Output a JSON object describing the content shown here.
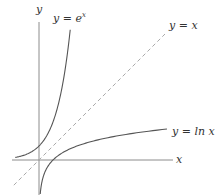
{
  "chart_data": {
    "type": "line",
    "title": "",
    "xlabel": "x",
    "ylabel": "y",
    "grid": false,
    "legend": "none (inline curve labels)",
    "xlim": [
      -1.9,
      9.6
    ],
    "ylim": [
      -2.5,
      9.3
    ],
    "series": [
      {
        "name": "y = e^x",
        "label": "y = e",
        "label_sup": "x",
        "style": "solid",
        "color": "#555555",
        "x": [
          -1.7,
          -1.0,
          -0.5,
          0,
          0.5,
          1.0,
          1.5,
          2.0,
          2.23
        ],
        "y": [
          0.18,
          0.37,
          0.61,
          1.0,
          1.65,
          2.72,
          4.48,
          7.39,
          9.3
        ]
      },
      {
        "name": "y = x",
        "label": "y = x",
        "style": "dashed",
        "color": "#aaaaaa",
        "x": [
          -1.8,
          9.0
        ],
        "y": [
          -1.8,
          9.0
        ]
      },
      {
        "name": "y = ln x",
        "label": "y = ln x",
        "style": "solid",
        "color": "#555555",
        "x": [
          0.088,
          0.2,
          0.5,
          1.0,
          2.0,
          4.0,
          6.0,
          9.14
        ],
        "y": [
          -2.43,
          -1.61,
          -0.69,
          0.0,
          0.69,
          1.39,
          1.79,
          2.21
        ]
      }
    ],
    "annotations": [
      "y = e^x",
      "y = x",
      "y = ln x"
    ]
  },
  "axes": {
    "x_label": "x",
    "y_label": "y"
  },
  "labels": {
    "exp": "y = e",
    "exp_sup": "x",
    "identity": "y = x",
    "log": "y = ln x"
  },
  "colors": {
    "axis": "#8c8c8c",
    "curve": "#555555",
    "dashed": "#aaaaaa",
    "text": "#333333"
  }
}
